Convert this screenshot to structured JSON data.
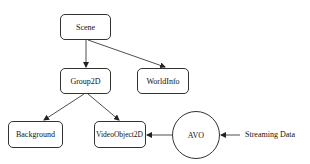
{
  "diagram": {
    "nodes": {
      "scene": "Scene",
      "group2d": "Group2D",
      "worldinfo": "WorldInfo",
      "background": "Background",
      "videoobject2d": "VideoObject2D",
      "avo": "AVO"
    },
    "input_label": "Streaming Data",
    "edges": [
      {
        "from": "Scene",
        "to": "Group2D"
      },
      {
        "from": "Scene",
        "to": "WorldInfo"
      },
      {
        "from": "Group2D",
        "to": "Background"
      },
      {
        "from": "Group2D",
        "to": "VideoObject2D"
      },
      {
        "from": "AVO",
        "to": "VideoObject2D"
      },
      {
        "from": "Streaming Data",
        "to": "AVO"
      }
    ]
  }
}
